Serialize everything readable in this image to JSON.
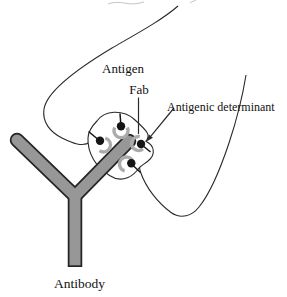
{
  "diagram": {
    "labels": {
      "antigen": "Antigen",
      "fab": "Fab",
      "antigenic_determinant": "Antigenic determinant",
      "antibody": "Antibody"
    },
    "colors": {
      "background": "#ffffff",
      "line": "#2a2a2a",
      "antibody_fill": "#979797",
      "antibody_outline": "#252525",
      "fab_arc": "#ababab",
      "determinant_dot": "#151515",
      "faint_remnant": "#c4c4c4",
      "text": "#111111"
    }
  }
}
